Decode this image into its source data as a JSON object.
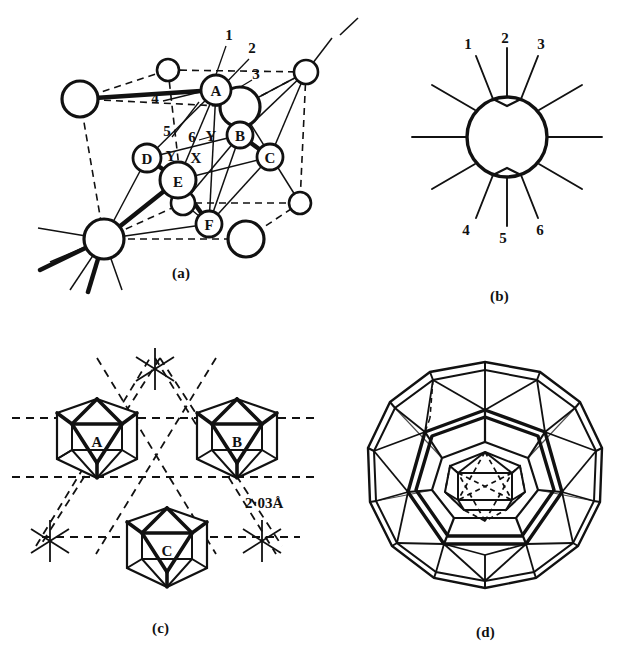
{
  "figure": {
    "background_color": "#ffffff",
    "stroke_color": "#111111",
    "panel_count": 4
  },
  "panels": [
    {
      "id": "a",
      "label": "(a)",
      "caption_label": "(a)",
      "description": "Rhombohedral unit cell with icosahedral boron atoms labelled A-F and bond directions numbered 1-6",
      "atom_labels": [
        "A",
        "B",
        "C",
        "D",
        "E",
        "F"
      ],
      "bond_numbers": [
        "1",
        "2",
        "3",
        "4",
        "5",
        "6"
      ],
      "axis_labels": [
        "Y",
        "X",
        "Y"
      ],
      "label_x": 175,
      "label_y": 268
    },
    {
      "id": "b",
      "label": "(b)",
      "caption_label": "(b)",
      "description": "Single icosahedron projected as a circle with twelve radiating bonds, six of them numbered",
      "bond_numbers_top": [
        "1",
        "2",
        "3"
      ],
      "bond_numbers_bottom": [
        "4",
        "5",
        "6"
      ],
      "spoke_count": 12,
      "label_x": 490,
      "label_y": 289
    },
    {
      "id": "c",
      "label": "(c)",
      "caption_label": "(c)",
      "description": "Three linked icosahedra A, B and C in a layer with inter-icosahedral distance marked",
      "icosahedra_labels": [
        "A",
        "B",
        "C"
      ],
      "dimension_label": "2·03Å",
      "label_x": 155,
      "label_y": 625
    },
    {
      "id": "d",
      "label": "(d)",
      "caption_label": "(d)",
      "description": "Nested polyhedral shell: outer truncated icosahedral cage enclosing an inner icosahedron shown with dashed hidden edges",
      "label_x": 480,
      "label_y": 628
    }
  ],
  "panel_a": {
    "atoms": [
      {
        "label": "A",
        "cx": 216,
        "cy": 90,
        "r": 15,
        "weight": "bold"
      },
      {
        "label": "B",
        "cx": 240,
        "cy": 135,
        "r": 13,
        "weight": "bold"
      },
      {
        "label": "C",
        "cx": 270,
        "cy": 157,
        "r": 13,
        "weight": "bold"
      },
      {
        "label": "D",
        "cx": 147,
        "cy": 158,
        "r": 14,
        "weight": "bold"
      },
      {
        "label": "E",
        "cx": 178,
        "cy": 180,
        "r": 18,
        "weight": "bold"
      },
      {
        "label": "F",
        "cx": 209,
        "cy": 224,
        "r": 13,
        "weight": "bold"
      }
    ],
    "plain_atoms": [
      {
        "cx": 168,
        "cy": 70,
        "r": 11
      },
      {
        "cx": 306,
        "cy": 72,
        "r": 12
      },
      {
        "cx": 80,
        "cy": 99,
        "r": 18
      },
      {
        "cx": 240,
        "cy": 107,
        "r": 20
      },
      {
        "cx": 183,
        "cy": 203,
        "r": 12
      },
      {
        "cx": 300,
        "cy": 203,
        "r": 11
      },
      {
        "cx": 104,
        "cy": 239,
        "r": 20
      },
      {
        "cx": 246,
        "cy": 239,
        "r": 18
      }
    ],
    "numbers": [
      {
        "text": "1",
        "x": 229,
        "y": 40
      },
      {
        "text": "2",
        "x": 252,
        "y": 53
      },
      {
        "text": "3",
        "x": 256,
        "y": 79
      },
      {
        "text": "4",
        "x": 155,
        "y": 103
      },
      {
        "text": "5",
        "x": 167,
        "y": 136
      },
      {
        "text": "6",
        "x": 192,
        "y": 142
      }
    ],
    "axes": [
      {
        "text": "Y",
        "x": 211,
        "y": 136
      },
      {
        "text": "Y",
        "x": 171,
        "y": 156
      },
      {
        "text": "X",
        "x": 196,
        "y": 158
      }
    ]
  },
  "panel_b": {
    "circle": {
      "cx": 507,
      "cy": 137,
      "r": 40
    },
    "numbers": [
      {
        "text": "1",
        "x": 468,
        "y": 49
      },
      {
        "text": "2",
        "x": 505,
        "y": 43
      },
      {
        "text": "3",
        "x": 541,
        "y": 49
      },
      {
        "text": "4",
        "x": 466,
        "y": 230
      },
      {
        "text": "5",
        "x": 503,
        "y": 238
      },
      {
        "text": "6",
        "x": 540,
        "y": 230
      }
    ]
  },
  "panel_c": {
    "icosahedra": [
      {
        "label": "A",
        "cx": 97,
        "cy": 447,
        "r": 48
      },
      {
        "label": "B",
        "cx": 237,
        "cy": 447,
        "r": 48
      },
      {
        "label": "C",
        "cx": 167,
        "cy": 551,
        "r": 48
      }
    ],
    "dimension": {
      "text": "2·03Å",
      "x": 255,
      "y": 503
    }
  },
  "panel_d": {
    "outer_cage": {
      "cx": 485,
      "cy": 490,
      "r": 125
    },
    "inner_icosahedron": {
      "cx": 485,
      "cy": 483,
      "r": 38
    }
  }
}
